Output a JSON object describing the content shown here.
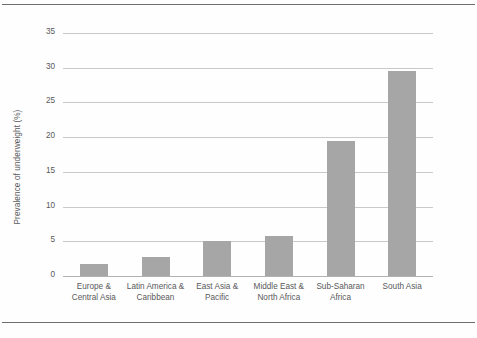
{
  "chart_data": {
    "type": "bar",
    "title": "",
    "subtitle": "",
    "xlabel": "",
    "ylabel": "Prevalence of underweight (%)",
    "ylim": [
      0,
      35
    ],
    "yticks": [
      "0",
      "5",
      "10",
      "15",
      "20",
      "25",
      "30",
      "35"
    ],
    "grid": true,
    "legend": "none",
    "orientation": "vertical",
    "bar_color": "#a6a6a6",
    "gridline_color": "#c9c9c9",
    "categories": [
      "Europe & Central Asia",
      "Latin America & Caribbean",
      "East Asia & Pacific",
      "Middle East & North Africa",
      "Sub-Saharan Africa",
      "South Asia"
    ],
    "category_lines": [
      {
        "line1": "Europe &",
        "line2": "Central Asia"
      },
      {
        "line1": "Latin America &",
        "line2": "Caribbean"
      },
      {
        "line1": "East Asia &",
        "line2": "Pacific"
      },
      {
        "line1": "Middle East &",
        "line2": "North Africa"
      },
      {
        "line1": "Sub-Saharan",
        "line2": "Africa"
      },
      {
        "line1": "South Asia",
        "line2": ""
      }
    ],
    "values": [
      1.7,
      2.8,
      5.0,
      5.7,
      19.5,
      29.6
    ]
  }
}
